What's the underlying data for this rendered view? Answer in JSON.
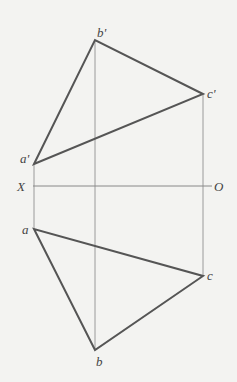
{
  "diagram": {
    "axis": {
      "left_label": "X",
      "right_label": "O",
      "y": 186,
      "x1": 33,
      "x2": 212
    },
    "front_view": {
      "points": [
        {
          "label": "a'",
          "x": 34,
          "y": 164
        },
        {
          "label": "b'",
          "x": 95,
          "y": 40
        },
        {
          "label": "c'",
          "x": 203,
          "y": 94
        }
      ]
    },
    "top_view": {
      "points": [
        {
          "label": "a",
          "x": 34,
          "y": 229
        },
        {
          "label": "b",
          "x": 95,
          "y": 350
        },
        {
          "label": "c",
          "x": 203,
          "y": 276
        }
      ]
    },
    "colors": {
      "edge": "#555555",
      "projector": "#9a9a9a",
      "axis": "#888888",
      "label": "#444444"
    }
  }
}
